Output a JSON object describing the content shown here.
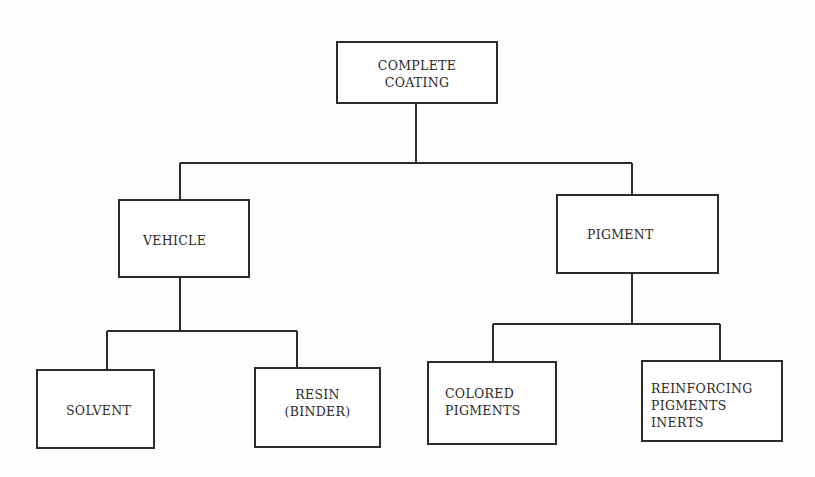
{
  "diagram": {
    "type": "hierarchy",
    "root": {
      "id": "complete-coating",
      "lines": [
        "COMPLETE",
        "COATING"
      ]
    },
    "level1": [
      {
        "id": "vehicle",
        "lines": [
          "VEHICLE"
        ]
      },
      {
        "id": "pigment",
        "lines": [
          "PIGMENT"
        ]
      }
    ],
    "level2": [
      {
        "id": "solvent",
        "parent": "vehicle",
        "lines": [
          "SOLVENT"
        ]
      },
      {
        "id": "resin",
        "parent": "vehicle",
        "lines": [
          "RESIN",
          "(BINDER)"
        ]
      },
      {
        "id": "colored-pigments",
        "parent": "pigment",
        "lines": [
          "COLORED",
          "PIGMENTS"
        ]
      },
      {
        "id": "reinforcing-pigments",
        "parent": "pigment",
        "lines": [
          "REINFORCING",
          "PIGMENTS",
          "INERTS"
        ]
      }
    ],
    "edges": [
      [
        "complete-coating",
        "vehicle"
      ],
      [
        "complete-coating",
        "pigment"
      ],
      [
        "vehicle",
        "solvent"
      ],
      [
        "vehicle",
        "resin"
      ],
      [
        "pigment",
        "colored-pigments"
      ],
      [
        "pigment",
        "reinforcing-pigments"
      ]
    ]
  }
}
